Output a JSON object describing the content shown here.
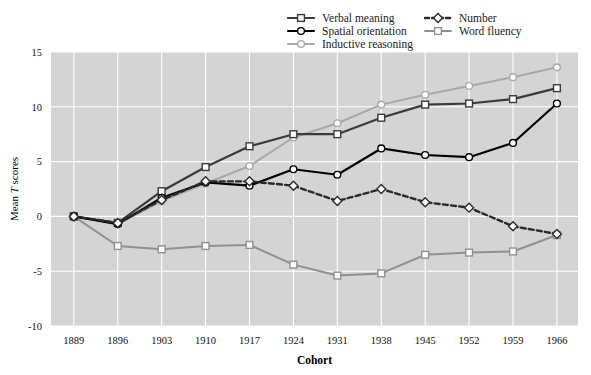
{
  "chart_data": {
    "type": "line",
    "title": "",
    "xlabel": "Cohort",
    "ylabel": "Mean T scores",
    "ylabel_plain": "Mean ",
    "ylabel_italic": "T",
    "ylabel_tail": " scores",
    "categories": [
      1889,
      1896,
      1903,
      1910,
      1917,
      1924,
      1931,
      1938,
      1945,
      1952,
      1959,
      1966
    ],
    "xtick_labels": [
      "1889",
      "1896",
      "1903",
      "1910",
      "1917",
      "1924",
      "1931",
      "1938",
      "1945",
      "1952",
      "1959",
      "1966"
    ],
    "ytick_labels": [
      "15",
      "10",
      "5",
      "0",
      "-5",
      "-10"
    ],
    "yticks": [
      15,
      10,
      5,
      0,
      -5,
      -10
    ],
    "ylim": [
      -10,
      15
    ],
    "grid": true,
    "grid_color": "#ffffff",
    "plot_bgcolor": "#d4d4d4",
    "legend_position": "top",
    "series": [
      {
        "name": "Verbal meaning",
        "marker": "square",
        "dash": "solid",
        "color": "#3a3a3a",
        "width": 2.2,
        "values": [
          0,
          -0.6,
          2.3,
          4.5,
          6.4,
          7.5,
          7.5,
          9.0,
          10.2,
          10.3,
          10.7,
          11.7
        ]
      },
      {
        "name": "Spatial orientation",
        "marker": "circle",
        "dash": "solid",
        "color": "#000000",
        "width": 2.2,
        "values": [
          0,
          -0.7,
          1.7,
          3.1,
          2.8,
          4.3,
          3.8,
          6.2,
          5.6,
          5.4,
          6.7,
          10.3
        ]
      },
      {
        "name": "Inductive reasoning",
        "marker": "circle",
        "dash": "solid",
        "color": "#a8a8a8",
        "width": 2.0,
        "values": [
          0,
          -0.7,
          1.4,
          3.0,
          4.6,
          7.2,
          8.5,
          10.2,
          11.1,
          11.9,
          12.7,
          13.6
        ]
      },
      {
        "name": "Number",
        "marker": "diamond",
        "dash": "dashed",
        "color": "#2a2a2a",
        "width": 2.4,
        "values": [
          0,
          -0.6,
          1.5,
          3.2,
          3.2,
          2.8,
          1.4,
          2.5,
          1.3,
          0.8,
          -0.9,
          -1.6
        ]
      },
      {
        "name": "Word fluency",
        "marker": "square",
        "dash": "solid",
        "color": "#909090",
        "width": 2.0,
        "values": [
          0,
          -2.7,
          -3.0,
          -2.7,
          -2.6,
          -4.4,
          -5.4,
          -5.2,
          -3.5,
          -3.3,
          -3.2,
          -1.7
        ]
      }
    ]
  },
  "legend": {
    "entries": [
      {
        "label": "Verbal meaning",
        "col": 0,
        "row": 0
      },
      {
        "label": "Spatial orientation",
        "col": 0,
        "row": 1
      },
      {
        "label": "Inductive reasoning",
        "col": 0,
        "row": 2
      },
      {
        "label": "Number",
        "col": 1,
        "row": 0
      },
      {
        "label": "Word fluency",
        "col": 1,
        "row": 1
      }
    ]
  }
}
